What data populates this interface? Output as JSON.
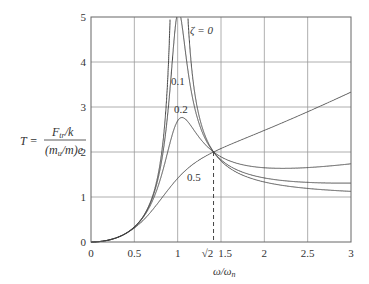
{
  "chart_data": {
    "type": "line",
    "title": "",
    "xlabel": "ω/ω_n",
    "ylabel": "T = (F_tr/k) / ((m_u/m)e)",
    "xlim": [
      0,
      3
    ],
    "ylim": [
      0,
      5
    ],
    "grid": true,
    "x_ticks": [
      "0",
      "0.5",
      "1",
      "√2",
      "1.5",
      "2",
      "2.5",
      "3"
    ],
    "y_ticks": [
      "0",
      "1",
      "2",
      "3",
      "4",
      "5"
    ],
    "series": [
      {
        "name": "ζ = 0",
        "zeta": 0,
        "label": "ζ = 0"
      },
      {
        "name": "0.1",
        "zeta": 0.1,
        "label": "0.1"
      },
      {
        "name": "0.2",
        "zeta": 0.2,
        "label": "0.2"
      },
      {
        "name": "0.5",
        "zeta": 0.5,
        "label": "0.5"
      }
    ],
    "sample_points": {
      "x": [
        0,
        0.5,
        1.0,
        1.414,
        2.0,
        2.5,
        3.0
      ],
      "zeta_0": [
        0,
        0.33,
        null,
        2.0,
        1.33,
        1.19,
        1.125
      ],
      "zeta_0.1": [
        0,
        0.34,
        5.1,
        2.0,
        1.37,
        1.25,
        1.2
      ],
      "zeta_0.2": [
        0,
        0.34,
        2.69,
        2.0,
        1.48,
        1.43,
        1.45
      ],
      "zeta_0.5": [
        0,
        0.32,
        1.41,
        2.0,
        1.97,
        2.6,
        3.33
      ]
    },
    "annotations": [
      {
        "text": "ζ = 0",
        "x": 1.55,
        "y": 4.7
      },
      {
        "text": "0.1",
        "x": 0.98,
        "y": 3.6
      },
      {
        "text": "0.2",
        "x": 1.0,
        "y": 2.95
      },
      {
        "text": "0.5",
        "x": 1.1,
        "y": 1.65
      },
      {
        "text": "dashed vertical at √2",
        "x": 1.414,
        "y": 2.0
      }
    ]
  },
  "labels": {
    "y_T": "T =",
    "y_num": "F",
    "y_num_sub": "tr",
    "y_num_rest": "/k",
    "y_den": "(m",
    "y_den_sub": "u",
    "y_den_rest": "/m)e",
    "x_axis": "ω/ω",
    "x_axis_sub": "n"
  },
  "colors": {
    "axis": "#555555",
    "grid": "#9a9a9a",
    "curve": "#444444",
    "text": "#333333"
  }
}
